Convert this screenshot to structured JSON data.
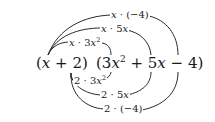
{
  "diagram": {
    "factor_left": {
      "open": "(",
      "term1_var": "x",
      "op": "+",
      "term2": "2",
      "close": ")"
    },
    "factor_right": {
      "open": "(",
      "term1_coef": "3",
      "term1_var": "x",
      "term1_exp": "2",
      "op1": "+",
      "term2_coef": "5",
      "term2_var": "x",
      "op2": "−",
      "term3": "4",
      "close": ")"
    },
    "upper_products": [
      {
        "a": "x",
        "dot": "·",
        "b_coef": "3",
        "b_var": "x",
        "b_exp": "2"
      },
      {
        "a": "x",
        "dot": "·",
        "b_coef": "5",
        "b_var": "x"
      },
      {
        "a": "x",
        "dot": "·",
        "b": "(−4)"
      }
    ],
    "lower_products": [
      {
        "a": "2",
        "dot": "·",
        "b_coef": "3",
        "b_var": "x",
        "b_exp": "2"
      },
      {
        "a": "2",
        "dot": "·",
        "b_coef": "5",
        "b_var": "x"
      },
      {
        "a": "2",
        "dot": "·",
        "b": "(−4)"
      }
    ]
  }
}
